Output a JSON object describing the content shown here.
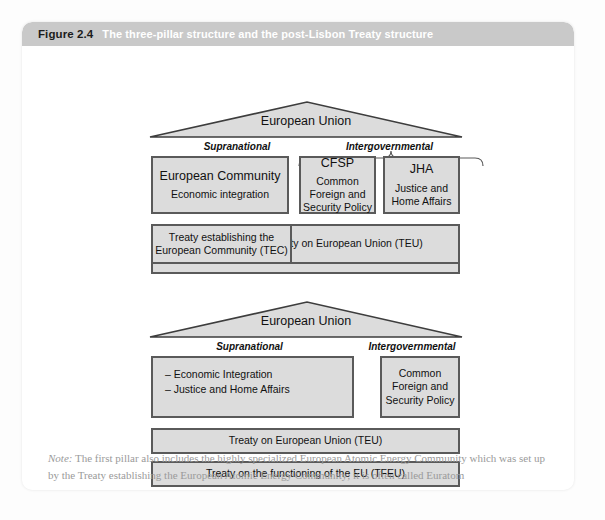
{
  "figure": {
    "number": "Figure 2.4",
    "caption": "The three-pillar structure and the post-Lisbon Treaty structure",
    "note_label": "Note:",
    "note_text": " The first pillar also includes the highly specialized European Atomic Energy Community which was set up by the Treaty establishing the European Atomic Energy Community; it is often called Euratom"
  },
  "colors": {
    "header_bar": "#c9c9c9",
    "box_fill": "#dcdcdc",
    "box_border": "#5a5a5a",
    "panel_bg": "#ffffff",
    "note_text": "#9a9a9a"
  },
  "diagram_top": {
    "roof_label": "European Union",
    "category_left": "Supranational",
    "category_right": "Intergovernmental",
    "pillars": [
      {
        "title": "European Community",
        "subtitle": "Economic integration"
      },
      {
        "title": "CFSP",
        "subtitle": "Common Foreign and Security Policy"
      },
      {
        "title": "JHA",
        "subtitle": "Justice and Home Affairs"
      }
    ],
    "treaties": [
      {
        "label": "Treaty establishing the European Community (TEC)"
      },
      {
        "label": "Treaty on European Union (TEU)"
      },
      {
        "label": ""
      }
    ]
  },
  "diagram_bottom": {
    "roof_label": "European Union",
    "category_left": "Supranational",
    "category_right": "Intergovernmental",
    "left_box_items": [
      "– Economic Integration",
      "– Justice and Home Affairs"
    ],
    "right_box_label": "Common Foreign and Security Policy",
    "treaties": [
      {
        "label": "Treaty on European Union (TEU)"
      },
      {
        "label": "Treaty on the functioning of the EU (TFEU)"
      }
    ]
  }
}
